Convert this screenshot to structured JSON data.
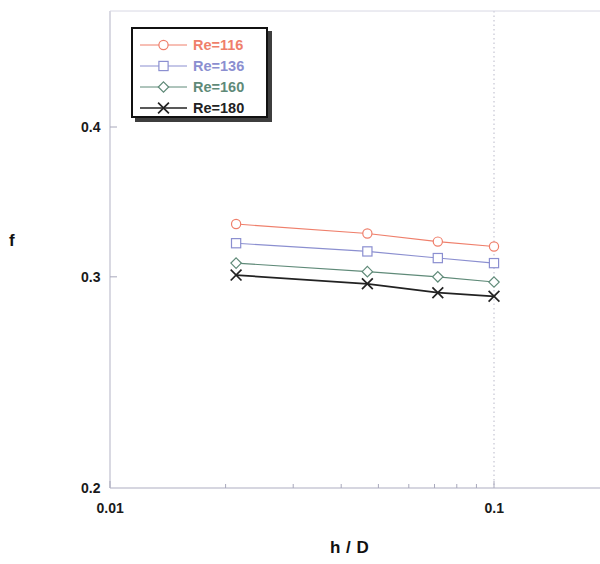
{
  "chart_data": {
    "type": "line",
    "title": "",
    "xlabel": "h / D",
    "ylabel": "f",
    "xscale": "log",
    "yscale": "log",
    "xlim": [
      0.01,
      0.13
    ],
    "ylim": [
      0.2,
      0.44
    ],
    "x_ticks": [
      {
        "value": 0.01,
        "label": "0.01"
      },
      {
        "value": 0.1,
        "label": "0.1"
      }
    ],
    "y_ticks": [
      {
        "value": 0.2,
        "label": "0.2"
      },
      {
        "value": 0.3,
        "label": "0.3"
      },
      {
        "value": 0.4,
        "label": "0.4"
      }
    ],
    "grid": "vertical-dotted-at-0.1",
    "legend_position": "top-left",
    "x": [
      0.0213,
      0.0468,
      0.0714,
      0.1
    ],
    "series": [
      {
        "name": "Re=116",
        "color": "#ef7f6b",
        "marker": "circle",
        "values": [
          0.332,
          0.326,
          0.321,
          0.318
        ]
      },
      {
        "name": "Re=136",
        "color": "#8b8fd0",
        "marker": "square",
        "values": [
          0.32,
          0.315,
          0.311,
          0.308
        ]
      },
      {
        "name": "Re=160",
        "color": "#5f8a78",
        "marker": "diamond",
        "values": [
          0.308,
          0.303,
          0.3,
          0.297
        ]
      },
      {
        "name": "Re=180",
        "color": "#222222",
        "marker": "cross",
        "values": [
          0.301,
          0.296,
          0.291,
          0.289
        ]
      }
    ]
  },
  "axes": {
    "y_label": "f",
    "x_label": "h / D"
  },
  "legend": {
    "entries": [
      {
        "label": "Re=116"
      },
      {
        "label": "Re=136"
      },
      {
        "label": "Re=160"
      },
      {
        "label": "Re=180"
      }
    ]
  }
}
